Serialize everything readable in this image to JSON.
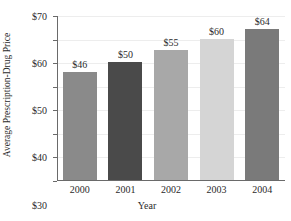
{
  "chart_data": {
    "type": "bar",
    "title": "",
    "xlabel": "Year",
    "ylabel": "Average Prescription-Drug Price",
    "categories": [
      "2000",
      "2001",
      "2002",
      "2003",
      "2004"
    ],
    "values": [
      46,
      50,
      55,
      60,
      64
    ],
    "value_labels": [
      "$46",
      "$50",
      "$55",
      "$60",
      "$64"
    ],
    "bar_colors": [
      "#8a8a8a",
      "#4a4a4a",
      "#a8a8a8",
      "#d5d5d5",
      "#7a7a7a"
    ],
    "ylim": [
      0,
      70
    ],
    "ytick_values": [
      0,
      10,
      20,
      30,
      40,
      50,
      60,
      70
    ],
    "ytick_labels": [
      "0",
      "$10",
      "$20",
      "$30",
      "$40",
      "$50",
      "$60",
      "$70"
    ],
    "grid": true,
    "legend": false,
    "legend_position": "none"
  },
  "axis_colors": {
    "axis_line": "#6a6a6a",
    "gridline": "#ededed",
    "text": "#2b2b2b",
    "background": "#ffffff"
  }
}
